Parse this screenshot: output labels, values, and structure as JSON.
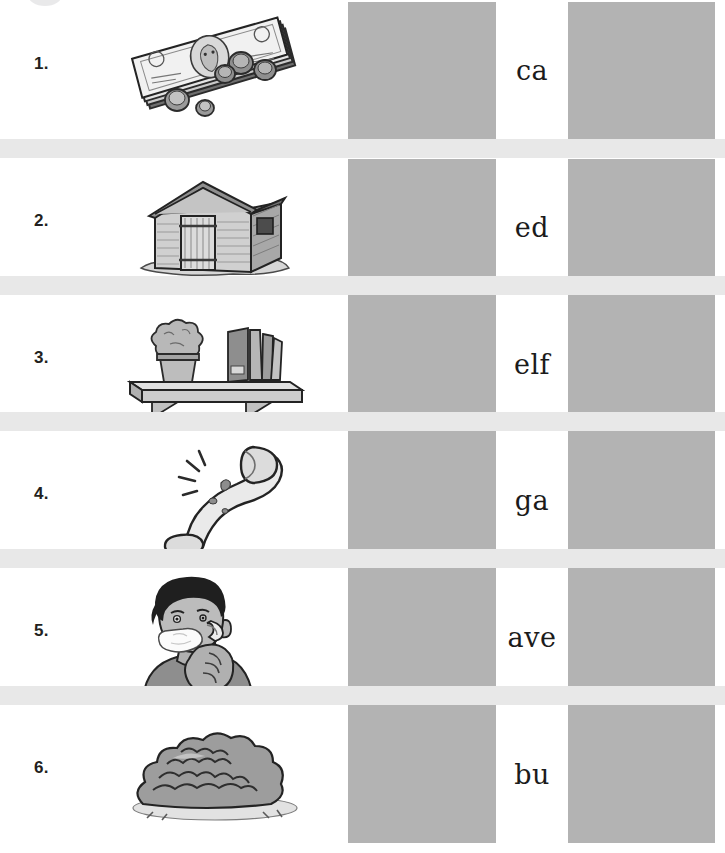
{
  "worksheet": {
    "title": "Digraph sh — picture and letter matching worksheet",
    "page_marker_icon": "circle-marker-icon",
    "colors": {
      "answer_box": "#b3b3b3",
      "separator_band": "#e8e8e8",
      "text": "#1b1b1b",
      "page_background": "#ffffff"
    },
    "rows": [
      {
        "number": "1.",
        "picture_icon": "money-cash-icon",
        "picture_label": "stack of dollar bills with coins",
        "letters": "ca",
        "box_first_value": "",
        "box_second_value": ""
      },
      {
        "number": "2.",
        "picture_icon": "garden-shed-icon",
        "picture_label": "wooden garden shed with pitched roof",
        "letters": "ed",
        "box_first_value": "",
        "box_second_value": ""
      },
      {
        "number": "3.",
        "picture_icon": "wall-shelf-icon",
        "picture_label": "wall shelf holding a potted plant and books",
        "letters": "elf",
        "box_first_value": "",
        "box_second_value": ""
      },
      {
        "number": "4.",
        "picture_icon": "injured-shin-leg-icon",
        "picture_label": "bent leg with a sore shin",
        "letters": "ga",
        "box_first_value": "",
        "box_second_value": ""
      },
      {
        "number": "5.",
        "picture_icon": "man-shaving-icon",
        "picture_label": "man shaving his face with a razor",
        "letters": "ave",
        "box_first_value": "",
        "box_second_value": ""
      },
      {
        "number": "6.",
        "picture_icon": "bush-shrub-icon",
        "picture_label": "round leafy bush on the ground",
        "letters": "bu",
        "box_first_value": "",
        "box_second_value": ""
      }
    ]
  }
}
